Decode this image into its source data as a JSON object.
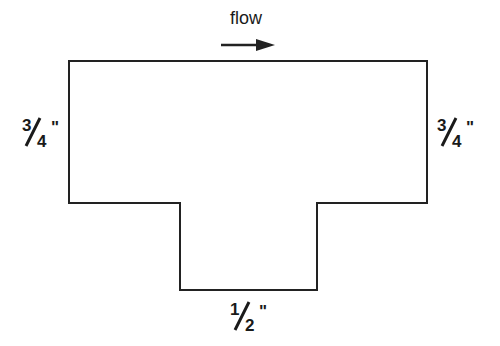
{
  "diagram": {
    "flow_label": "flow",
    "flow_direction": "right",
    "left_label": {
      "numerator": "3",
      "denominator": "4",
      "unit": "\""
    },
    "right_label": {
      "numerator": "3",
      "denominator": "4",
      "unit": "\""
    },
    "bottom_label": {
      "numerator": "1",
      "denominator": "2",
      "unit": "\""
    },
    "line_color": "#222222"
  }
}
